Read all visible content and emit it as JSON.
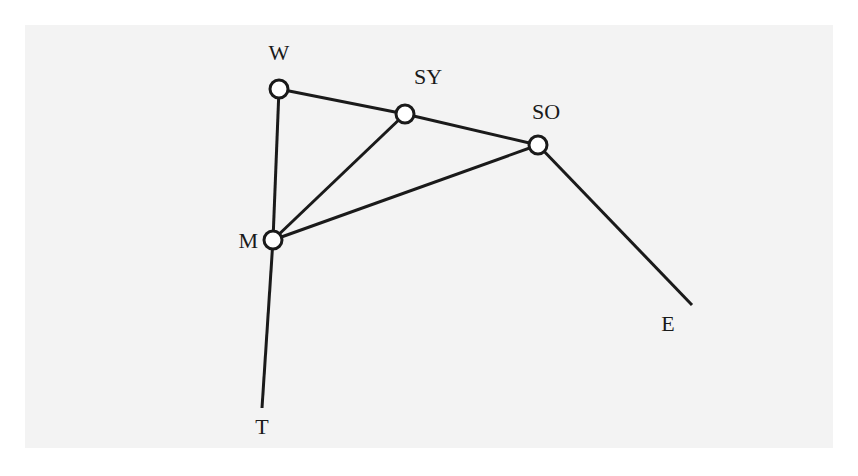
{
  "diagram": {
    "type": "network-graph",
    "nodes": [
      {
        "id": "W",
        "label": "W",
        "x": 279,
        "y": 89,
        "has_circle": true,
        "label_x": 279,
        "label_y": 60,
        "anchor": "middle"
      },
      {
        "id": "SY",
        "label": "SY",
        "x": 405,
        "y": 114,
        "has_circle": true,
        "label_x": 428,
        "label_y": 84,
        "anchor": "middle"
      },
      {
        "id": "SO",
        "label": "SO",
        "x": 538,
        "y": 145,
        "has_circle": true,
        "label_x": 546,
        "label_y": 119,
        "anchor": "middle"
      },
      {
        "id": "M",
        "label": "M",
        "x": 273,
        "y": 240,
        "has_circle": true,
        "label_x": 258,
        "label_y": 248,
        "anchor": "end"
      },
      {
        "id": "E",
        "label": "E",
        "x": 692,
        "y": 305,
        "has_circle": false,
        "label_x": 668,
        "label_y": 331,
        "anchor": "middle"
      },
      {
        "id": "T",
        "label": "T",
        "x": 262,
        "y": 408,
        "has_circle": false,
        "label_x": 262,
        "label_y": 434,
        "anchor": "middle"
      }
    ],
    "edges": [
      {
        "from": "W",
        "to": "SY"
      },
      {
        "from": "SY",
        "to": "SO"
      },
      {
        "from": "W",
        "to": "M"
      },
      {
        "from": "SY",
        "to": "M"
      },
      {
        "from": "SO",
        "to": "M"
      },
      {
        "from": "SO",
        "to": "E"
      },
      {
        "from": "M",
        "to": "T"
      }
    ],
    "colors": {
      "line": "#1a1a1a",
      "node_fill": "#ffffff",
      "background": "#f3f3f3"
    }
  }
}
